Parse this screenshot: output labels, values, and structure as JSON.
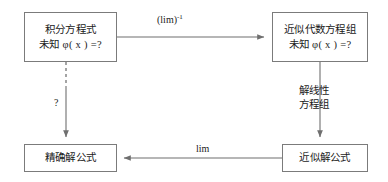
{
  "diagram": {
    "width": 388,
    "height": 182,
    "background": "#ffffff",
    "stroke_color": "#6f6f6f",
    "box_border_color": "#7b7b7b",
    "text_color": "#1a1a1a",
    "nodes": [
      {
        "id": "integral-equation",
        "position": "top-left",
        "lines": [
          "积分方程式",
          "未知 φ( x ) =?"
        ]
      },
      {
        "id": "approx-algebraic-system",
        "position": "top-right",
        "lines": [
          "近似代数方程组",
          "未知 φ( x ) =?"
        ]
      },
      {
        "id": "exact-solution-formula",
        "position": "bottom-left",
        "lines": [
          "精确解公式"
        ]
      },
      {
        "id": "approx-solution-formula",
        "position": "bottom-right",
        "lines": [
          "近似解公式"
        ]
      }
    ],
    "edges": [
      {
        "id": "top-edge",
        "from": "integral-equation",
        "to": "approx-algebraic-system",
        "direction": "right",
        "style": "solid",
        "label": "(lim)",
        "label_superscript": "-1"
      },
      {
        "id": "right-edge",
        "from": "approx-algebraic-system",
        "to": "approx-solution-formula",
        "direction": "down",
        "style": "solid",
        "label_lines": [
          "解线性",
          "方程组"
        ]
      },
      {
        "id": "bottom-edge",
        "from": "approx-solution-formula",
        "to": "exact-solution-formula",
        "direction": "left",
        "style": "solid",
        "label": "lim"
      },
      {
        "id": "left-edge",
        "from": "integral-equation",
        "to": "exact-solution-formula",
        "direction": "down",
        "style": "dashed-then-solid",
        "label": "?"
      }
    ]
  }
}
